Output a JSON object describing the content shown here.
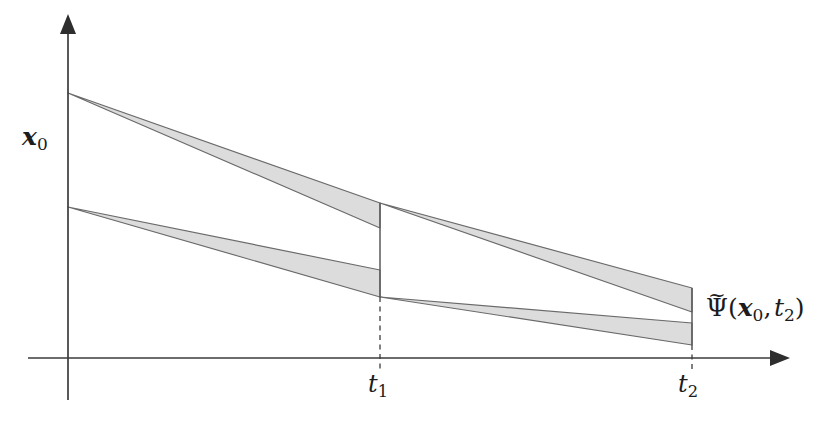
{
  "figure": {
    "kind": "reachable-set-tube-diagram",
    "background_color": "#ffffff",
    "axes": {
      "origin": {
        "x": 68,
        "y": 358
      },
      "x_axis": {
        "start_x": 28,
        "end_x": 790,
        "y": 358,
        "arrow": "right"
      },
      "y_axis": {
        "x": 68,
        "start_y": 400,
        "end_y": 14,
        "arrow": "up"
      },
      "axis_color": "#3b3b3b"
    },
    "labels": {
      "y_axis_label": {
        "base": "x",
        "sub": "0",
        "text": "x₀"
      },
      "tick_t1": {
        "base": "t",
        "sub": "1",
        "text": "t₁"
      },
      "tick_t2": {
        "base": "t",
        "sub": "2",
        "text": "t₂"
      },
      "set_label": {
        "head": "Ψ",
        "accent": "~",
        "args": "(x₀, t₂)",
        "text": "Ψ̃(x₀, t₂)"
      }
    },
    "ticks": [
      {
        "name": "t1",
        "x": 380,
        "dash_from_y": 297,
        "dash_to_y": 370
      },
      {
        "name": "t2",
        "x": 692,
        "dash_from_y": 345,
        "dash_to_y": 370
      }
    ],
    "band_fill": "#dcdcdc",
    "band_stroke": "#6a6a6a"
  },
  "chart_data": {
    "type": "area",
    "title": "",
    "xlabel": "",
    "ylabel": "",
    "grid": false,
    "legend": "none",
    "x_ticks": [
      {
        "label": "t₁",
        "pixel_x": 380
      },
      {
        "label": "t₂",
        "pixel_x": 692
      }
    ],
    "y_ticks": [
      {
        "label": "x₀",
        "pixel_y": 150
      }
    ],
    "series": [
      {
        "name": "upper-band-segment-1",
        "segment": 1,
        "start": {
          "x": 68,
          "y_top": 93,
          "y_bottom": 93
        },
        "end": {
          "x": 380,
          "y_top": 203,
          "y_bottom": 228
        }
      },
      {
        "name": "lower-band-segment-1",
        "segment": 1,
        "start": {
          "x": 68,
          "y_top": 207,
          "y_bottom": 207
        },
        "end": {
          "x": 380,
          "y_top": 270,
          "y_bottom": 297
        }
      },
      {
        "name": "upper-band-segment-2",
        "segment": 2,
        "start": {
          "x": 380,
          "y_top": 203,
          "y_bottom": 203
        },
        "end": {
          "x": 692,
          "y_top": 288,
          "y_bottom": 312
        }
      },
      {
        "name": "lower-band-segment-2",
        "segment": 2,
        "start": {
          "x": 380,
          "y_top": 297,
          "y_bottom": 297
        },
        "end": {
          "x": 692,
          "y_top": 323,
          "y_bottom": 345
        }
      }
    ],
    "connector_lines": [
      {
        "name": "t1-vertical-connector",
        "x": 380,
        "y_from": 203,
        "y_to": 297
      },
      {
        "name": "t2-vertical-connector",
        "x": 692,
        "y_from": 288,
        "y_to": 345
      }
    ]
  }
}
